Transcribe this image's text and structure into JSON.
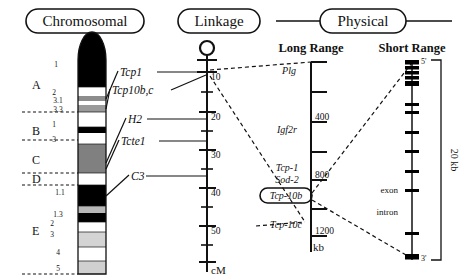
{
  "figure": {
    "panels": [
      {
        "id": "chromosomal",
        "title": "Chromosomal",
        "style": "capsule"
      },
      {
        "id": "linkage",
        "title": "Linkage",
        "style": "capsule"
      },
      {
        "id": "physical",
        "title": "Physical",
        "style": "capsule-with-rules"
      }
    ]
  },
  "chromosome": {
    "arm_labels": [
      {
        "label": "A",
        "y": 85
      },
      {
        "label": "B",
        "y": 131
      },
      {
        "label": "C",
        "y": 160
      },
      {
        "label": "D",
        "y": 179
      },
      {
        "label": "E",
        "y": 231
      }
    ],
    "sub_bands": [
      {
        "label": "1",
        "y": 65
      },
      {
        "label": "2",
        "y": 92
      },
      {
        "label": "3.1",
        "y": 100
      },
      {
        "label": "3.3",
        "y": 110
      },
      {
        "label": "1",
        "y": 124
      },
      {
        "label": "3",
        "y": 139
      },
      {
        "label": "1.1",
        "y": 192
      },
      {
        "label": "1.3",
        "y": 215
      },
      {
        "label": "2",
        "y": 224
      },
      {
        "label": "3",
        "y": 234
      },
      {
        "label": "4",
        "y": 252
      },
      {
        "label": "5",
        "y": 268
      }
    ],
    "bands": [
      {
        "from": 32,
        "to": 87,
        "shade": "#000000",
        "cap": "round-top"
      },
      {
        "from": 87,
        "to": 96,
        "shade": "#ffffff"
      },
      {
        "from": 96,
        "to": 101,
        "shade": "#8c8c8c"
      },
      {
        "from": 101,
        "to": 105,
        "shade": "#ffffff"
      },
      {
        "from": 105,
        "to": 112,
        "shade": "#9a9a9a"
      },
      {
        "from": 112,
        "to": 127,
        "shade": "#ffffff"
      },
      {
        "from": 127,
        "to": 133,
        "shade": "#000000"
      },
      {
        "from": 133,
        "to": 144,
        "shade": "#ffffff"
      },
      {
        "from": 144,
        "to": 173,
        "shade": "#808080"
      },
      {
        "from": 173,
        "to": 185,
        "shade": "#ffffff"
      },
      {
        "from": 185,
        "to": 206,
        "shade": "#000000"
      },
      {
        "from": 206,
        "to": 213,
        "shade": "#b8b8b8"
      },
      {
        "from": 213,
        "to": 222,
        "shade": "#000000"
      },
      {
        "from": 222,
        "to": 232,
        "shade": "#ffffff"
      },
      {
        "from": 232,
        "to": 247,
        "shade": "#d4d4d4"
      },
      {
        "from": 247,
        "to": 261,
        "shade": "#ffffff"
      },
      {
        "from": 261,
        "to": 274,
        "shade": "#d0d0d0"
      }
    ],
    "band_divider_y": [
      112,
      140,
      173,
      185,
      274
    ]
  },
  "gene_labels": [
    {
      "name": "Tcp1",
      "x": 118,
      "y": 74
    },
    {
      "name": "Tcp10b,c",
      "x": 110,
      "y": 92
    },
    {
      "name": "H2",
      "x": 126,
      "y": 121
    },
    {
      "name": "Tcte1",
      "x": 119,
      "y": 143
    },
    {
      "name": "C3",
      "x": 129,
      "y": 178
    }
  ],
  "linkage_map": {
    "unit": "cM",
    "centromere": "circle",
    "tick_labels": [
      "10",
      "20",
      "30",
      "40",
      "50"
    ],
    "tick_values": [
      10,
      20,
      30,
      40,
      50
    ],
    "minor_ticks": [
      5,
      15,
      25,
      35,
      45,
      55
    ]
  },
  "long_range": {
    "heading": "Long Range",
    "unit": "kb",
    "tick_labels": [
      "400",
      "800",
      "1200"
    ],
    "tick_values": [
      400,
      800,
      1200
    ],
    "minor_ticks": [
      200,
      600,
      1000
    ],
    "markers": [
      {
        "name": "Plg",
        "boxed": false
      },
      {
        "name": "Igf2r",
        "boxed": false
      },
      {
        "name": "Tcp-1",
        "boxed": false
      },
      {
        "name": "Sod-2",
        "boxed": false
      },
      {
        "name": "Tcp-10b",
        "boxed": true
      },
      {
        "name": "Tcp-10c",
        "boxed": false
      }
    ]
  },
  "short_range": {
    "heading": "Short Range",
    "span_label": "20 kb",
    "five_prime": "5'",
    "three_prime": "3'",
    "feature_labels": [
      {
        "label": "exon"
      },
      {
        "label": "intron"
      }
    ],
    "exon_positions": [
      62,
      68,
      74,
      80,
      86,
      104,
      112,
      131,
      150,
      170,
      189,
      232,
      258
    ]
  },
  "colors": {
    "ink": "#111111",
    "background": "#ffffff",
    "band_dark": "#000000",
    "band_mid": "#808080",
    "band_light": "#d0d0d0"
  }
}
